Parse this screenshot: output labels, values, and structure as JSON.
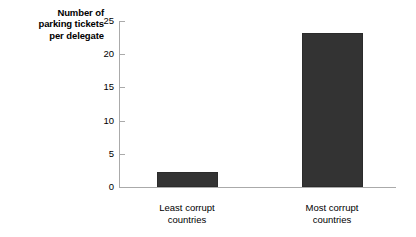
{
  "chart_data": {
    "type": "bar",
    "title": "",
    "xlabel": "",
    "ylabel": "Number of parking tickets per delegate",
    "ylabel_lines": [
      "Number of",
      "parking tickets",
      "per delegate"
    ],
    "categories": [
      "Least corrupt countries",
      "Most corrupt countries"
    ],
    "category_lines": [
      [
        "Least corrupt",
        "countries"
      ],
      [
        "Most corrupt",
        "countries"
      ]
    ],
    "values": [
      2.3,
      23.2
    ],
    "ylim": [
      0,
      25
    ],
    "yticks": [
      0,
      5,
      10,
      15,
      20,
      25
    ],
    "ytick_labels": [
      "0",
      "5",
      "10",
      "15",
      "20",
      "25"
    ],
    "grid": false,
    "legend": false,
    "bar_color": "#333333",
    "axis_color": "#aaaaaa",
    "background_color": "#ffffff"
  },
  "axis": {
    "y_title_line1": "Number of",
    "y_title_line2": "parking tickets",
    "y_title_line3": "per delegate",
    "tick_0": "0",
    "tick_5": "5",
    "tick_10": "10",
    "tick_15": "15",
    "tick_20": "20",
    "tick_25": "25"
  },
  "bars": [
    {
      "label_line1": "Least corrupt",
      "label_line2": "countries",
      "value": 2.3
    },
    {
      "label_line1": "Most corrupt",
      "label_line2": "countries",
      "value": 23.2
    }
  ]
}
